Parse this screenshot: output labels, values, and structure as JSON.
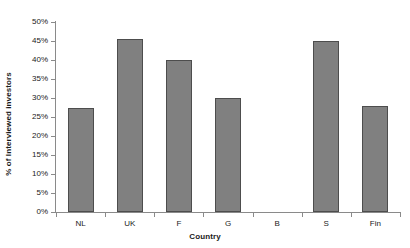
{
  "chart_data": {
    "type": "bar",
    "title": "",
    "xlabel": "Country",
    "ylabel": "% of Interviewed investors",
    "categories": [
      "NL",
      "UK",
      "F",
      "G",
      "B",
      "S",
      "Fin"
    ],
    "values": [
      27.5,
      45.5,
      40,
      30,
      0,
      45,
      28
    ],
    "ylim": [
      0,
      50
    ],
    "ytick_step": 5,
    "ytick_labels": [
      "0%",
      "5%",
      "10%",
      "15%",
      "20%",
      "25%",
      "30%",
      "35%",
      "40%",
      "45%",
      "50%"
    ],
    "ytick_values": [
      0,
      5,
      10,
      15,
      20,
      25,
      30,
      35,
      40,
      45,
      50
    ],
    "grid": false,
    "legend": false,
    "series_color": "#808080",
    "series_border_color": "#4d4d4d",
    "axis_color": "#8a8a8a",
    "background": "#ffffff"
  }
}
